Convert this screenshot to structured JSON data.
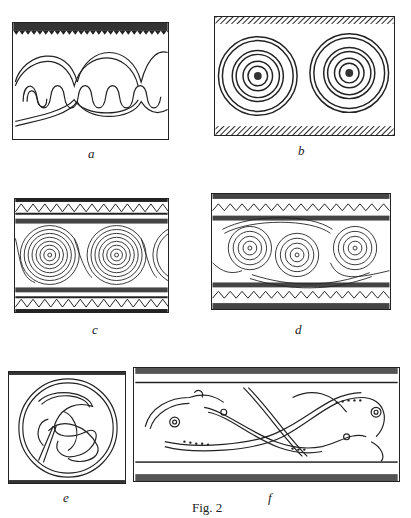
{
  "figure": {
    "caption": "Fig. 2",
    "panels": [
      {
        "id": "a",
        "label": "a",
        "motif": "interlaced wave band with serrated top border"
      },
      {
        "id": "b",
        "label": "b",
        "motif": "two concentric circle rosettes with hatched borders"
      },
      {
        "id": "c",
        "label": "c",
        "motif": "running spiral band with zigzag borders"
      },
      {
        "id": "d",
        "label": "d",
        "motif": "double running spiral band with zigzag borders"
      },
      {
        "id": "e",
        "label": "e",
        "motif": "interlaced beast in roundel"
      },
      {
        "id": "f",
        "label": "f",
        "motif": "interlaced beasts frieze"
      }
    ]
  }
}
